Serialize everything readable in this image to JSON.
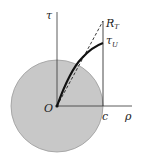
{
  "diagram": {
    "axes": {
      "vertical_label": "τ",
      "horizontal_label": "ρ"
    },
    "labels": {
      "origin": "O",
      "radius_point": "c",
      "top_point_main": "R",
      "top_point_sub": "T",
      "curve_end_main": "τ",
      "curve_end_sub": "U"
    },
    "colors": {
      "disk_fill": "#c8c8c8",
      "disk_stroke": "#9a9a9a",
      "line": "#333333",
      "curve": "#111111"
    }
  }
}
